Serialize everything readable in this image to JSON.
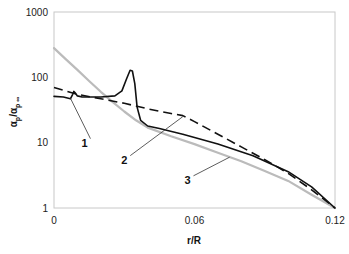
{
  "chart_data": {
    "type": "line",
    "title": "",
    "xlabel": "r/R",
    "ylabel": "αp/αp∞",
    "ylabel_main": "α",
    "ylabel_sub1": "p",
    "ylabel_sep": "/α",
    "ylabel_sub2": "p ∞",
    "xlim": [
      0,
      0.12
    ],
    "ylim": [
      1,
      1000
    ],
    "yscale": "log",
    "grid": false,
    "legend": "none",
    "x_ticks": [
      {
        "value": 0,
        "label": "0"
      },
      {
        "value": 0.06,
        "label": "0.06"
      },
      {
        "value": 0.12,
        "label": "0.12"
      }
    ],
    "y_ticks": [
      {
        "value": 1,
        "label": "1"
      },
      {
        "value": 10,
        "label": "10"
      },
      {
        "value": 100,
        "label": "100"
      },
      {
        "value": 1000,
        "label": "1000"
      }
    ],
    "series": [
      {
        "name": "1",
        "style": "solid",
        "color": "#111111",
        "x": [
          0,
          0.004,
          0.007,
          0.008,
          0.0085,
          0.009,
          0.01,
          0.012,
          0.02,
          0.026,
          0.029,
          0.031,
          0.0325,
          0.0335,
          0.0345,
          0.0355,
          0.037,
          0.04,
          0.045,
          0.055,
          0.07,
          0.085,
          0.1,
          0.11,
          0.12
        ],
        "y": [
          51,
          50,
          47,
          55,
          61,
          58,
          52,
          50,
          50,
          52,
          62,
          95,
          128,
          125,
          80,
          35,
          22,
          18,
          16.5,
          13.5,
          9.5,
          6.3,
          3.6,
          2.1,
          1
        ]
      },
      {
        "name": "2",
        "style": "dashed",
        "color": "#111111",
        "x": [
          0,
          0.005,
          0.01,
          0.02,
          0.03,
          0.04,
          0.05,
          0.055,
          0.06,
          0.07,
          0.08,
          0.09,
          0.1,
          0.11,
          0.12
        ],
        "y": [
          70,
          62,
          55,
          47,
          40,
          33,
          28,
          26,
          21,
          13.5,
          8.6,
          5.5,
          3.4,
          1.9,
          1
        ]
      },
      {
        "name": "3",
        "style": "solid",
        "color": "#bbbbbb",
        "x": [
          0,
          0.005,
          0.01,
          0.015,
          0.02,
          0.025,
          0.03,
          0.035,
          0.04,
          0.05,
          0.06,
          0.07,
          0.08,
          0.09,
          0.1,
          0.11,
          0.12
        ],
        "y": [
          280,
          190,
          130,
          88,
          60,
          42,
          30,
          22,
          17,
          12.5,
          9.5,
          7,
          5.2,
          3.7,
          2.6,
          1.6,
          1
        ]
      }
    ],
    "annotations": [
      {
        "label": "1",
        "series": "1",
        "point": [
          0.007,
          48
        ],
        "text_at": [
          0.013,
          10
        ]
      },
      {
        "label": "2",
        "series": "2",
        "point": [
          0.055,
          25
        ],
        "text_at": [
          0.03,
          5.5
        ]
      },
      {
        "label": "3",
        "series": "3",
        "point": [
          0.075,
          6
        ],
        "text_at": [
          0.057,
          2.7
        ]
      }
    ]
  }
}
